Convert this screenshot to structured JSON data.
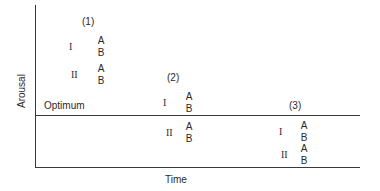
{
  "axes": {
    "y_label": "Arousal",
    "x_label": "Time",
    "reference_line_label": "Optimum"
  },
  "phases": [
    {
      "label": "(1)",
      "groups": [
        {
          "roman": "I",
          "items": [
            "A",
            "B"
          ]
        },
        {
          "roman": "II",
          "items": [
            "A",
            "B"
          ]
        }
      ]
    },
    {
      "label": "(2)",
      "groups": [
        {
          "roman": "I",
          "items": [
            "A",
            "B"
          ]
        },
        {
          "roman": "II",
          "items": [
            "A",
            "B"
          ]
        }
      ]
    },
    {
      "label": "(3)",
      "groups": [
        {
          "roman": "I",
          "items": [
            "A",
            "B"
          ]
        },
        {
          "roman": "II",
          "items": [
            "A",
            "B"
          ]
        }
      ]
    }
  ],
  "colors": {
    "ink": "#2a2a2a",
    "background": "#ffffff"
  }
}
